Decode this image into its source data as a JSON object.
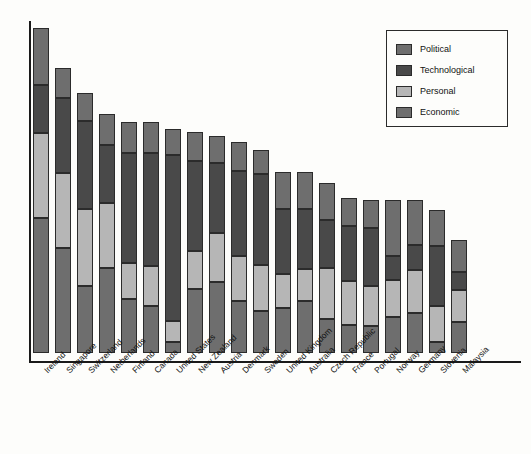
{
  "chart_data": {
    "type": "bar",
    "subtype": "stacked-vertical",
    "title": "",
    "subtitle": "",
    "xlabel": "",
    "ylabel": "",
    "grid": false,
    "axis": {
      "y_visible": true,
      "x_visible": true,
      "y_ticks": [],
      "y_tick_labels": [],
      "ylim": [
        0,
        100
      ]
    },
    "legend": {
      "position": "top-right",
      "entries": [
        {
          "label": "Political",
          "color": "#6e6e6e"
        },
        {
          "label": "Technological",
          "color": "#494949"
        },
        {
          "label": "Personal",
          "color": "#b6b6b6"
        },
        {
          "label": "Economic",
          "color": "#6e6e6e"
        }
      ]
    },
    "stack_order_top_to_bottom": [
      "Political",
      "Technological",
      "Personal",
      "Economic"
    ],
    "categories": [
      "Ireland",
      "Singapore",
      "Switzerland",
      "Netherlands",
      "Finland",
      "Canada",
      "United States",
      "New Zealand",
      "Austria",
      "Denmark",
      "Sweden",
      "United Kingdom",
      "Australia",
      "Czech Republic",
      "France",
      "Portugal",
      "Norway",
      "Germany",
      "Slovenia",
      "Malaysia"
    ],
    "series": [
      {
        "name": "Political",
        "color": "#6e6e6e",
        "values": [
          17.1,
          9.0,
          8.4,
          9.3,
          9.3,
          9.3,
          7.8,
          8.7,
          8.1,
          8.7,
          7.2,
          11.1,
          11.1,
          11.1,
          8.4,
          8.4,
          16.8,
          13.5,
          10.8,
          9.6
        ]
      },
      {
        "name": "Technological",
        "color": "#494949",
        "values": [
          14.4,
          22.5,
          26.4,
          17.4,
          33.0,
          33.9,
          40.5,
          27.0,
          21.0,
          25.5,
          27.3,
          19.5,
          18.0,
          14.4,
          16.5,
          17.4,
          7.2,
          7.5,
          18.0,
          5.4
        ]
      },
      {
        "name": "Personal",
        "color": "#b6b6b6",
        "values": [
          25.5,
          22.5,
          23.1,
          19.5,
          10.8,
          12.0,
          3.9,
          11.4,
          14.7,
          13.5,
          13.8,
          10.2,
          9.6,
          15.3,
          13.2,
          12.0,
          11.1,
          12.9,
          10.8,
          9.6
        ]
      },
      {
        "name": "Economic",
        "color": "#6e6e6e",
        "values": [
          40.5,
          31.5,
          20.1,
          28.8,
          23.1,
          20.4,
          3.3,
          18.9,
          21.6,
          18.9,
          18.9,
          16.2,
          14.7,
          8.7,
          10.2,
          9.6,
          9.6,
          9.9,
          9.3,
          12.0
        ]
      }
    ],
    "totals": [
      97.5,
      85.5,
      78.0,
      75.0,
      76.2,
      75.6,
      55.5,
      66.0,
      65.4,
      66.6,
      67.2,
      57.0,
      53.4,
      49.5,
      48.3,
      47.4,
      44.7,
      43.8,
      48.9,
      36.6
    ]
  },
  "bars": [
    {
      "label": "Ireland",
      "x": 33,
      "segments": [
        {
          "name": "Political",
          "top": 28,
          "height": 57,
          "color": "#6e6e6e"
        },
        {
          "name": "Technological",
          "top": 85,
          "height": 48,
          "color": "#494949"
        },
        {
          "name": "Personal",
          "top": 133,
          "height": 85,
          "color": "#b6b6b6"
        },
        {
          "name": "Economic",
          "top": 218,
          "height": 135,
          "color": "#6e6e6e"
        }
      ]
    },
    {
      "label": "Singapore",
      "x": 55,
      "segments": [
        {
          "name": "Political",
          "top": 68,
          "height": 30,
          "color": "#6e6e6e"
        },
        {
          "name": "Technological",
          "top": 98,
          "height": 75,
          "color": "#494949"
        },
        {
          "name": "Personal",
          "top": 173,
          "height": 75,
          "color": "#b6b6b6"
        },
        {
          "name": "Economic",
          "top": 248,
          "height": 105,
          "color": "#6e6e6e"
        }
      ]
    },
    {
      "label": "Switzerland",
      "x": 77,
      "segments": [
        {
          "name": "Political",
          "top": 93,
          "height": 28,
          "color": "#6e6e6e"
        },
        {
          "name": "Technological",
          "top": 121,
          "height": 88,
          "color": "#494949"
        },
        {
          "name": "Personal",
          "top": 209,
          "height": 77,
          "color": "#b6b6b6"
        },
        {
          "name": "Economic",
          "top": 286,
          "height": 67,
          "color": "#6e6e6e"
        }
      ]
    },
    {
      "label": "Netherlands",
      "x": 99,
      "segments": [
        {
          "name": "Political",
          "top": 114,
          "height": 31,
          "color": "#6e6e6e"
        },
        {
          "name": "Technological",
          "top": 145,
          "height": 58,
          "color": "#494949"
        },
        {
          "name": "Personal",
          "top": 203,
          "height": 65,
          "color": "#b6b6b6"
        },
        {
          "name": "Economic",
          "top": 268,
          "height": 85,
          "color": "#6e6e6e"
        }
      ]
    },
    {
      "label": "Finland",
      "x": 121,
      "segments": [
        {
          "name": "Political",
          "top": 122,
          "height": 31,
          "color": "#6e6e6e"
        },
        {
          "name": "Technological",
          "top": 153,
          "height": 110,
          "color": "#494949"
        },
        {
          "name": "Personal",
          "top": 263,
          "height": 36,
          "color": "#b6b6b6"
        },
        {
          "name": "Economic",
          "top": 299,
          "height": 54,
          "color": "#6e6e6e"
        }
      ]
    },
    {
      "label": "Canada",
      "x": 143,
      "segments": [
        {
          "name": "Political",
          "top": 122,
          "height": 31,
          "color": "#6e6e6e"
        },
        {
          "name": "Technological",
          "top": 153,
          "height": 113,
          "color": "#494949"
        },
        {
          "name": "Personal",
          "top": 266,
          "height": 40,
          "color": "#b6b6b6"
        },
        {
          "name": "Economic",
          "top": 306,
          "height": 47,
          "color": "#6e6e6e"
        }
      ]
    },
    {
      "label": "United States",
      "x": 165,
      "segments": [
        {
          "name": "Political",
          "top": 129,
          "height": 26,
          "color": "#6e6e6e"
        },
        {
          "name": "Technological",
          "top": 155,
          "height": 166,
          "color": "#494949"
        },
        {
          "name": "Personal",
          "top": 321,
          "height": 21,
          "color": "#b6b6b6"
        },
        {
          "name": "Economic",
          "top": 342,
          "height": 11,
          "color": "#6e6e6e"
        }
      ]
    },
    {
      "label": "New Zealand",
      "x": 187,
      "segments": [
        {
          "name": "Political",
          "top": 132,
          "height": 29,
          "color": "#6e6e6e"
        },
        {
          "name": "Technological",
          "top": 161,
          "height": 90,
          "color": "#494949"
        },
        {
          "name": "Personal",
          "top": 251,
          "height": 38,
          "color": "#b6b6b6"
        },
        {
          "name": "Economic",
          "top": 289,
          "height": 64,
          "color": "#6e6e6e"
        }
      ]
    },
    {
      "label": "Austria",
      "x": 209,
      "segments": [
        {
          "name": "Political",
          "top": 136,
          "height": 27,
          "color": "#6e6e6e"
        },
        {
          "name": "Technological",
          "top": 163,
          "height": 70,
          "color": "#494949"
        },
        {
          "name": "Personal",
          "top": 233,
          "height": 49,
          "color": "#b6b6b6"
        },
        {
          "name": "Economic",
          "top": 282,
          "height": 71,
          "color": "#6e6e6e"
        }
      ]
    },
    {
      "label": "Denmark",
      "x": 231,
      "segments": [
        {
          "name": "Political",
          "top": 142,
          "height": 29,
          "color": "#6e6e6e"
        },
        {
          "name": "Technological",
          "top": 171,
          "height": 85,
          "color": "#494949"
        },
        {
          "name": "Personal",
          "top": 256,
          "height": 45,
          "color": "#b6b6b6"
        },
        {
          "name": "Economic",
          "top": 301,
          "height": 52,
          "color": "#6e6e6e"
        }
      ]
    },
    {
      "label": "Sweden",
      "x": 253,
      "segments": [
        {
          "name": "Political",
          "top": 150,
          "height": 24,
          "color": "#6e6e6e"
        },
        {
          "name": "Technological",
          "top": 174,
          "height": 91,
          "color": "#494949"
        },
        {
          "name": "Personal",
          "top": 265,
          "height": 46,
          "color": "#b6b6b6"
        },
        {
          "name": "Economic",
          "top": 311,
          "height": 42,
          "color": "#6e6e6e"
        }
      ]
    },
    {
      "label": "United Kingdom",
      "x": 275,
      "segments": [
        {
          "name": "Political",
          "top": 172,
          "height": 37,
          "color": "#6e6e6e"
        },
        {
          "name": "Technological",
          "top": 209,
          "height": 65,
          "color": "#494949"
        },
        {
          "name": "Personal",
          "top": 274,
          "height": 34,
          "color": "#b6b6b6"
        },
        {
          "name": "Economic",
          "top": 308,
          "height": 45,
          "color": "#6e6e6e"
        }
      ]
    },
    {
      "label": "Australia",
      "x": 297,
      "segments": [
        {
          "name": "Political",
          "top": 172,
          "height": 37,
          "color": "#6e6e6e"
        },
        {
          "name": "Technological",
          "top": 209,
          "height": 60,
          "color": "#494949"
        },
        {
          "name": "Personal",
          "top": 269,
          "height": 32,
          "color": "#b6b6b6"
        },
        {
          "name": "Economic",
          "top": 301,
          "height": 52,
          "color": "#6e6e6e"
        }
      ]
    },
    {
      "label": "Czech Republic",
      "x": 319,
      "segments": [
        {
          "name": "Political",
          "top": 183,
          "height": 37,
          "color": "#6e6e6e"
        },
        {
          "name": "Technological",
          "top": 220,
          "height": 48,
          "color": "#494949"
        },
        {
          "name": "Personal",
          "top": 268,
          "height": 51,
          "color": "#b6b6b6"
        },
        {
          "name": "Economic",
          "top": 319,
          "height": 34,
          "color": "#6e6e6e"
        }
      ]
    },
    {
      "label": "France",
      "x": 341,
      "segments": [
        {
          "name": "Political",
          "top": 198,
          "height": 28,
          "color": "#6e6e6e"
        },
        {
          "name": "Technological",
          "top": 226,
          "height": 55,
          "color": "#494949"
        },
        {
          "name": "Personal",
          "top": 281,
          "height": 44,
          "color": "#b6b6b6"
        },
        {
          "name": "Economic",
          "top": 325,
          "height": 28,
          "color": "#6e6e6e"
        }
      ]
    },
    {
      "label": "Portugal",
      "x": 363,
      "segments": [
        {
          "name": "Political",
          "top": 200,
          "height": 28,
          "color": "#6e6e6e"
        },
        {
          "name": "Technological",
          "top": 228,
          "height": 58,
          "color": "#494949"
        },
        {
          "name": "Personal",
          "top": 286,
          "height": 40,
          "color": "#b6b6b6"
        },
        {
          "name": "Economic",
          "top": 326,
          "height": 27,
          "color": "#6e6e6e"
        }
      ]
    },
    {
      "label": "Norway",
      "x": 385,
      "segments": [
        {
          "name": "Political",
          "top": 200,
          "height": 56,
          "color": "#6e6e6e"
        },
        {
          "name": "Technological",
          "top": 256,
          "height": 24,
          "color": "#494949"
        },
        {
          "name": "Personal",
          "top": 280,
          "height": 37,
          "color": "#b6b6b6"
        },
        {
          "name": "Economic",
          "top": 317,
          "height": 36,
          "color": "#6e6e6e"
        }
      ]
    },
    {
      "label": "Germany",
      "x": 407,
      "segments": [
        {
          "name": "Political",
          "top": 200,
          "height": 45,
          "color": "#6e6e6e"
        },
        {
          "name": "Technological",
          "top": 245,
          "height": 25,
          "color": "#494949"
        },
        {
          "name": "Personal",
          "top": 270,
          "height": 43,
          "color": "#b6b6b6"
        },
        {
          "name": "Economic",
          "top": 313,
          "height": 40,
          "color": "#6e6e6e"
        }
      ]
    },
    {
      "label": "Slovenia",
      "x": 429,
      "segments": [
        {
          "name": "Political",
          "top": 210,
          "height": 36,
          "color": "#6e6e6e"
        },
        {
          "name": "Technological",
          "top": 246,
          "height": 60,
          "color": "#494949"
        },
        {
          "name": "Personal",
          "top": 306,
          "height": 36,
          "color": "#b6b6b6"
        },
        {
          "name": "Economic",
          "top": 342,
          "height": 11,
          "color": "#6e6e6e"
        }
      ]
    },
    {
      "label": "Malaysia",
      "x": 451,
      "segments": [
        {
          "name": "Political",
          "top": 240,
          "height": 32,
          "color": "#6e6e6e"
        },
        {
          "name": "Technological",
          "top": 272,
          "height": 18,
          "color": "#494949"
        },
        {
          "name": "Personal",
          "top": 290,
          "height": 32,
          "color": "#b6b6b6"
        },
        {
          "name": "Economic",
          "top": 322,
          "height": 31,
          "color": "#6e6e6e"
        }
      ]
    }
  ]
}
